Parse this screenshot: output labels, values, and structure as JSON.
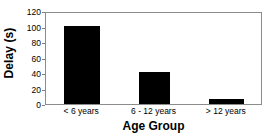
{
  "chart_data": {
    "type": "bar",
    "title": "",
    "subtitle": "",
    "xlabel": "Age Group",
    "ylabel": "Delay (s)",
    "categories": [
      "< 6 years",
      "6 - 12 years",
      "> 12 years"
    ],
    "values": [
      101,
      41,
      6
    ],
    "series": [
      {
        "name": "Delay",
        "values": [
          101,
          41,
          6
        ],
        "color": "#000000"
      }
    ],
    "ylim": [
      0,
      120
    ],
    "yticks": [
      0,
      20,
      40,
      60,
      80,
      100,
      120
    ],
    "ytick_labels": [
      "0",
      "20",
      "40",
      "60",
      "80",
      "100",
      "120"
    ],
    "xtick_labels": [
      "< 6 years",
      "6 - 12 years",
      "> 12 years"
    ],
    "grid": false,
    "legend": false,
    "legend_position": "none",
    "annotations": [],
    "bar_color": "#000000",
    "frame_color": "#8c8c8c",
    "background_color": "#ffffff",
    "axis_text_color": "#000000"
  }
}
